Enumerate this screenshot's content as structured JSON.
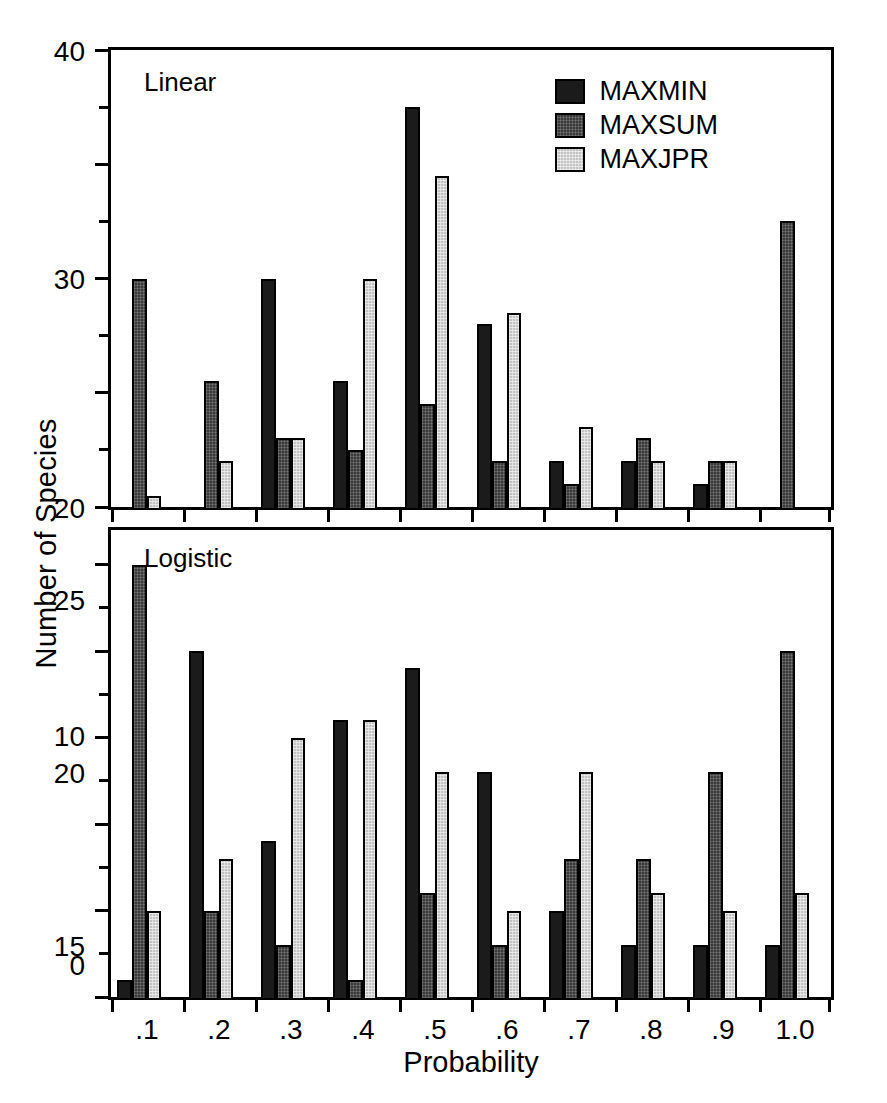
{
  "chart_data": {
    "type": "bar",
    "title": "",
    "xlabel": "Probability",
    "ylabel": "Number of Species",
    "grid": false,
    "legend_position": "top-right (upper panel)",
    "categories": [
      ".1",
      ".2",
      ".3",
      ".4",
      ".5",
      ".6",
      ".7",
      ".8",
      ".9",
      "1.0"
    ],
    "legend": [
      "MAXMIN",
      "MAXSUM",
      "MAXJPR"
    ],
    "colors": {
      "MAXMIN": "#1b1b1b",
      "MAXSUM": "#3a3a3a",
      "MAXJPR": "#c3c3c3",
      "axis": "#000000",
      "background": "#ffffff"
    },
    "panels": [
      {
        "name": "Linear",
        "ylim": [
          0,
          40
        ],
        "yticks": [
          0,
          10,
          20,
          30,
          40
        ],
        "ytick_labels": [
          "0",
          "10",
          "20",
          "30",
          "40"
        ],
        "yminor_step": 5,
        "series": [
          {
            "name": "MAXMIN",
            "values": [
              0,
              0,
              20,
              11,
              35,
              16,
              4,
              4,
              2,
              0
            ]
          },
          {
            "name": "MAXSUM",
            "values": [
              20,
              11,
              6,
              5,
              9,
              4,
              2,
              6,
              4,
              25
            ]
          },
          {
            "name": "MAXJPR",
            "values": [
              1,
              4,
              6,
              20,
              29,
              17,
              7,
              4,
              4,
              0
            ]
          }
        ]
      },
      {
        "name": "Logistic",
        "ylim": [
          0,
          27
        ],
        "yticks": [
          0,
          5,
          10,
          15,
          20,
          25
        ],
        "ytick_labels": [
          "0",
          "5",
          "10",
          "15",
          "20",
          "25"
        ],
        "yminor_step": 2.5,
        "series": [
          {
            "name": "MAXMIN",
            "values": [
              1,
              20,
              9,
              16,
              19,
              13,
              5,
              3,
              3,
              3
            ]
          },
          {
            "name": "MAXSUM",
            "values": [
              25,
              5,
              3,
              1,
              6,
              3,
              8,
              8,
              13,
              20
            ]
          },
          {
            "name": "MAXJPR",
            "values": [
              5,
              8,
              15,
              16,
              13,
              5,
              13,
              6,
              5,
              6
            ]
          }
        ]
      }
    ]
  },
  "axes": {
    "y_title": "Number of Species",
    "x_title": "Probability"
  }
}
